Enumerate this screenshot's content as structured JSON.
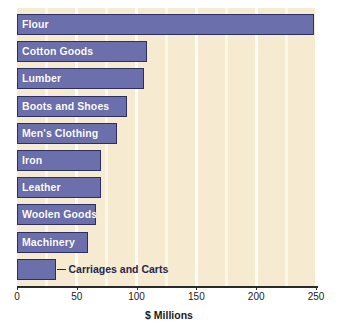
{
  "chart_data": {
    "type": "bar",
    "orientation": "horizontal",
    "title": "",
    "xlabel": "$ Millions",
    "ylabel": "",
    "xlim": [
      0,
      260
    ],
    "xticks": [
      0,
      50,
      100,
      150,
      200,
      250
    ],
    "xtick_labels": [
      "0",
      "50",
      "100",
      "150",
      "200",
      "250"
    ],
    "grid": true,
    "grid_axis": "x",
    "legend": false,
    "categories": [
      "Flour",
      "Cotton Goods",
      "Lumber",
      "Boots and Shoes",
      "Men's Clothing",
      "Iron",
      "Leather",
      "Woolen Goods",
      "Machinery",
      "Carriages and Carts"
    ],
    "values": [
      248,
      109,
      106,
      92,
      84,
      70,
      70,
      66,
      59,
      33
    ],
    "label_placement": [
      "inside",
      "inside",
      "inside",
      "inside",
      "inside",
      "inside",
      "inside",
      "inside",
      "inside",
      "outside"
    ],
    "colors": {
      "bar_fill": "#6b70ad",
      "bar_border": "#2b2f63",
      "plot_background": "#f6ead0",
      "gridline": "#fdf7e8",
      "inside_label_text": "#ffffff",
      "outside_label_text": "#23274f",
      "axis": "#2a2a2a",
      "page_background": "#ffffff"
    }
  }
}
